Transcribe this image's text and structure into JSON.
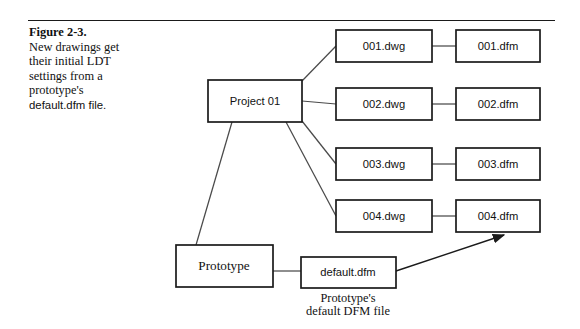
{
  "figure": {
    "number_label": "Figure 2-3.",
    "caption_line_1": "New drawings get",
    "caption_line_2": "their initial LDT",
    "caption_line_3": "settings from a",
    "caption_line_4": "prototype's",
    "caption_line_5": "default.dfm file."
  },
  "diagram": {
    "project_node": "Project 01",
    "prototype_node": "Prototype",
    "default_dfm_node": "default.dfm",
    "annotation_line_1": "Prototype's",
    "annotation_line_2": "default DFM file",
    "rows": [
      {
        "dwg": "001.dwg",
        "dfm": "001.dfm"
      },
      {
        "dwg": "002.dwg",
        "dfm": "002.dfm"
      },
      {
        "dwg": "003.dwg",
        "dfm": "003.dfm"
      },
      {
        "dwg": "004.dwg",
        "dfm": "004.dfm"
      }
    ]
  },
  "colors": {
    "ink": "#1a1a1a",
    "connector": "#4a4a4a",
    "background": "#ffffff"
  }
}
